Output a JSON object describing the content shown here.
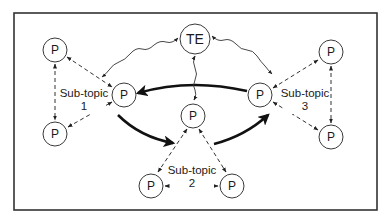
{
  "diagram": {
    "type": "network",
    "frame": {
      "x": 14,
      "y": 13,
      "width": 363,
      "height": 197
    },
    "nodes": [
      {
        "id": "te",
        "label": "TE",
        "cx": 195,
        "cy": 39,
        "r": 15
      },
      {
        "id": "p1a",
        "label": "P",
        "cx": 55,
        "cy": 50,
        "r": 12
      },
      {
        "id": "p1b",
        "label": "P",
        "cx": 124,
        "cy": 95,
        "r": 12
      },
      {
        "id": "p1c",
        "label": "P",
        "cx": 55,
        "cy": 134,
        "r": 12
      },
      {
        "id": "p3a",
        "label": "P",
        "cx": 331,
        "cy": 52,
        "r": 12
      },
      {
        "id": "p3b",
        "label": "P",
        "cx": 260,
        "cy": 95,
        "r": 12
      },
      {
        "id": "p3c",
        "label": "P",
        "cx": 331,
        "cy": 137,
        "r": 12
      },
      {
        "id": "p2a",
        "label": "P",
        "cx": 193,
        "cy": 116,
        "r": 12
      },
      {
        "id": "p2b",
        "label": "P",
        "cx": 151,
        "cy": 186,
        "r": 12
      },
      {
        "id": "p2c",
        "label": "P",
        "cx": 232,
        "cy": 186,
        "r": 12
      }
    ],
    "subtopics": [
      {
        "line1": "Sub-topic",
        "line2": "1",
        "x": 84,
        "y": 97
      },
      {
        "line1": "Sub-topic",
        "line2": "2",
        "x": 192,
        "y": 174
      },
      {
        "line1": "Sub-topic",
        "line2": "3",
        "x": 305,
        "y": 97
      }
    ],
    "edges": {
      "dashed_bidirectional": [
        [
          "p1a",
          "p1b"
        ],
        [
          "p1a",
          "p1c"
        ],
        [
          "p1b",
          "p1c"
        ],
        [
          "p3a",
          "p3b"
        ],
        [
          "p3a",
          "p3c"
        ],
        [
          "p3b",
          "p3c"
        ],
        [
          "p2a",
          "p2b"
        ],
        [
          "p2a",
          "p2c"
        ],
        [
          "p2b",
          "p2c"
        ]
      ],
      "wavy_bidirectional": [
        [
          "te",
          "p1b"
        ],
        [
          "te",
          "p3b"
        ],
        [
          "te",
          "p2a"
        ]
      ],
      "thick_directed": [
        [
          "p3b",
          "p1b"
        ],
        [
          "p1b",
          "p2a"
        ],
        [
          "p2a",
          "p3b"
        ]
      ]
    }
  }
}
